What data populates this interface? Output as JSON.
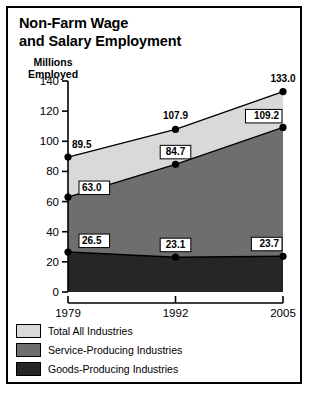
{
  "chart_data": {
    "type": "area",
    "title": "Non-Farm Wage and Salary Employment",
    "title_line1": "Non-Farm Wage",
    "title_line2": "and Salary Employment",
    "ylabel": "Millions Employed",
    "ylabel_line1": "Millions",
    "ylabel_line2": "Employed",
    "xlabel": "",
    "categories": [
      "1979",
      "1992",
      "2005"
    ],
    "x": [
      1979,
      1992,
      2005
    ],
    "ylim": [
      0,
      140
    ],
    "yticks": [
      0,
      20,
      40,
      60,
      80,
      100,
      120,
      140
    ],
    "grid": false,
    "legend_position": "below-axis-left",
    "stacked": true,
    "series": [
      {
        "name": "Total All Industries",
        "color": "#d9d9d9",
        "values": [
          89.5,
          107.9,
          133.0
        ],
        "labels": [
          "89.5",
          "107.9",
          "133.0"
        ],
        "label_style": "plain"
      },
      {
        "name": "Service-Producing Industries",
        "color": "#6e6e6e",
        "values": [
          63.0,
          84.7,
          109.2
        ],
        "labels": [
          "63.0",
          "84.7",
          "109.2"
        ],
        "label_style": "boxed"
      },
      {
        "name": "Goods-Producing Industries",
        "color": "#262626",
        "values": [
          26.5,
          23.1,
          23.7
        ],
        "labels": [
          "26.5",
          "23.1",
          "23.7"
        ],
        "label_style": "boxed"
      }
    ],
    "source": "Source: Bureau of Labor Statistics"
  },
  "legend": {
    "items": [
      {
        "label": "Total All Industries",
        "color": "#d9d9d9"
      },
      {
        "label": "Service-Producing Industries",
        "color": "#6e6e6e"
      },
      {
        "label": "Goods-Producing Industries",
        "color": "#262626"
      }
    ]
  },
  "axis": {
    "y_tick_labels": [
      "140",
      "120",
      "100",
      "80",
      "60",
      "40",
      "20",
      "0"
    ],
    "x_tick_labels": [
      "1979",
      "1992",
      "2005"
    ]
  },
  "colors": {
    "frame": "#000000",
    "background": "#ffffff",
    "total": "#d9d9d9",
    "service": "#6e6e6e",
    "goods": "#262626",
    "text": "#000000"
  }
}
